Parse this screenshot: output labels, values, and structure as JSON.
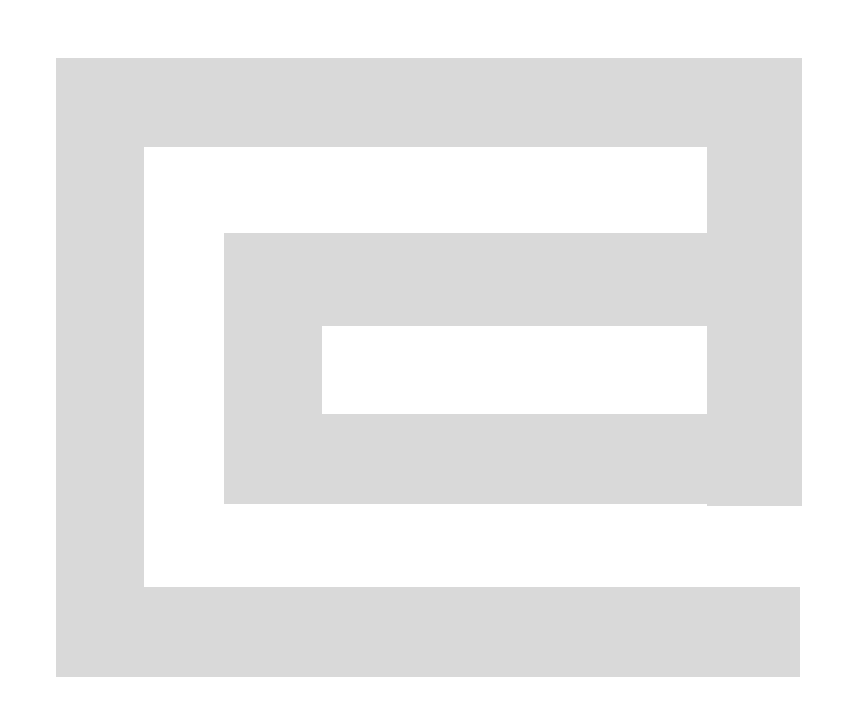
{
  "canvas": {
    "width": 843,
    "height": 727,
    "background_color": "#ffffff",
    "description": "Abstract geometric spiral / meander figure rendered as a single light-gray band on a white background"
  },
  "figure": {
    "name": "rectangular-spiral",
    "fill_color": "#d9d9d9",
    "stroke_color": "none",
    "band_thickness_px": 88,
    "turn_direction": "clockwise-inward",
    "outline_points": [
      [
        56,
        58
      ],
      [
        802,
        58
      ],
      [
        802,
        506
      ],
      [
        707,
        506
      ],
      [
        707,
        326
      ],
      [
        322,
        326
      ],
      [
        322,
        414
      ],
      [
        707,
        414
      ],
      [
        707,
        587
      ],
      [
        800,
        587
      ],
      [
        800,
        677
      ],
      [
        56,
        677
      ]
    ],
    "inner_hole_points": [
      [
        144,
        147
      ],
      [
        707,
        147
      ],
      [
        707,
        233
      ],
      [
        224,
        233
      ],
      [
        224,
        504
      ],
      [
        707,
        504
      ],
      [
        707,
        587
      ],
      [
        144,
        587
      ]
    ],
    "bounds": {
      "left": 56,
      "top": 58,
      "right": 802,
      "bottom": 677,
      "width": 746,
      "height": 619
    },
    "segments": [
      {
        "name": "outer-top-band",
        "x": 56,
        "y": 58,
        "width": 746,
        "height": 89
      },
      {
        "name": "outer-left-band",
        "x": 56,
        "y": 58,
        "width": 88,
        "height": 619
      },
      {
        "name": "outer-bottom-band",
        "x": 56,
        "y": 587,
        "width": 744,
        "height": 90
      },
      {
        "name": "outer-right-band",
        "x": 707,
        "y": 58,
        "width": 95,
        "height": 448
      },
      {
        "name": "inner-top-block",
        "x": 224,
        "y": 233,
        "width": 401,
        "height": 93
      },
      {
        "name": "inner-left-band",
        "x": 224,
        "y": 233,
        "width": 98,
        "height": 271
      },
      {
        "name": "inner-bottom-band",
        "x": 224,
        "y": 414,
        "width": 483,
        "height": 90
      }
    ]
  }
}
